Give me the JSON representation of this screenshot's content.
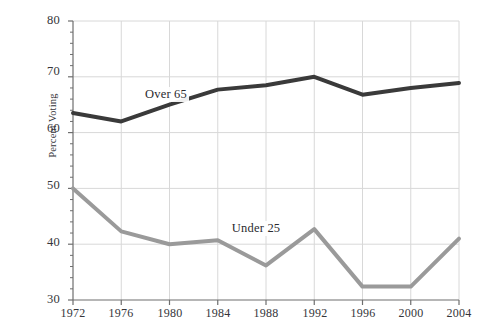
{
  "chart_data": {
    "type": "line",
    "title": "",
    "subtitle": "",
    "xlabel": "",
    "ylabel": "Percent Voting",
    "categories": [
      "1972",
      "1976",
      "1980",
      "1984",
      "1988",
      "1992",
      "1996",
      "2000",
      "2004"
    ],
    "x": [
      1972,
      1976,
      1980,
      1984,
      1988,
      1992,
      1996,
      2000,
      2004
    ],
    "xlim": [
      1972,
      2004
    ],
    "ylim": [
      30,
      80
    ],
    "yticks": [
      30,
      40,
      50,
      60,
      70,
      80
    ],
    "ytick_labels": [
      "30",
      "40",
      "50",
      "60",
      "70",
      "80"
    ],
    "y_minor_tick_step": 2,
    "grid": "horizontal-and-vertical",
    "legend": "inline-annotations",
    "series": [
      {
        "name": "Over 65",
        "color": "#3a3a3a",
        "line_width": 4,
        "values": [
          63.5,
          62.0,
          65.0,
          67.7,
          68.5,
          70.0,
          66.8,
          68.0,
          68.9
        ],
        "label_x": 1977.8,
        "label_y": 66.6
      },
      {
        "name": "Under 25",
        "color": "#9a9a9a",
        "line_width": 4,
        "values": [
          50.0,
          42.3,
          40.0,
          40.7,
          36.2,
          42.7,
          32.4,
          32.4,
          41.0
        ],
        "label_x": 1985.0,
        "label_y": 42.5
      }
    ],
    "annotations": [
      {
        "text": "Over 65",
        "series": "Over 65"
      },
      {
        "text": "Under 25",
        "series": "Under 25"
      }
    ]
  },
  "axis": {
    "y_title": "Percent Voting",
    "y_labels": [
      "80",
      "70",
      "60",
      "50",
      "40",
      "30"
    ],
    "x_labels": [
      "1972",
      "1976",
      "1980",
      "1984",
      "1988",
      "1992",
      "1996",
      "2000",
      "2004"
    ]
  },
  "colors": {
    "over65_line": "#3a3a3a",
    "under25_line": "#9a9a9a",
    "grid": "#d8d8d8",
    "axis": "#6e6e6e",
    "background": "#ffffff",
    "text": "#35353a"
  }
}
